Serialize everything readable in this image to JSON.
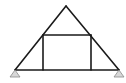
{
  "diagram": {
    "type": "truss",
    "colors": {
      "member": "#1a1a1a",
      "support_fill": "#d8d8d8",
      "support_stroke": "#8a8a8a",
      "background": "#ffffff"
    },
    "members": [
      {
        "name": "left-rafter",
        "from": "left-support",
        "to": "apex"
      },
      {
        "name": "right-rafter",
        "from": "apex",
        "to": "right-support"
      },
      {
        "name": "bottom-chord",
        "from": "left-support",
        "to": "right-support"
      },
      {
        "name": "collar-tie",
        "from": "left-rafter-joint",
        "to": "right-rafter-joint"
      },
      {
        "name": "left-post",
        "from": "left-rafter-joint",
        "to": "bottom-chord"
      },
      {
        "name": "right-post",
        "from": "right-rafter-joint",
        "to": "bottom-chord"
      }
    ],
    "supports": [
      {
        "name": "left-support",
        "kind": "pin"
      },
      {
        "name": "right-support",
        "kind": "pin"
      }
    ]
  }
}
